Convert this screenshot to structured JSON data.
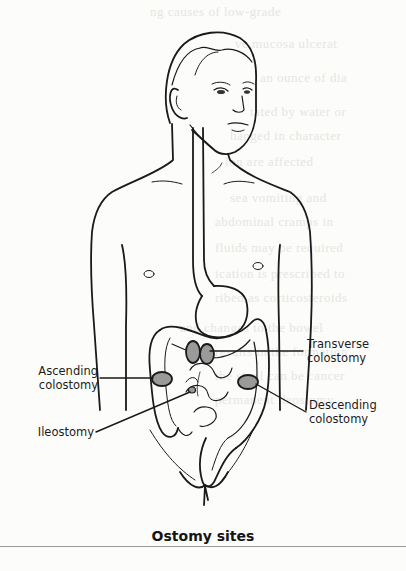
{
  "figure": {
    "title": "Ostomy sites",
    "labels": [
      {
        "id": "transverse",
        "text_line1": "Transverse",
        "text_line2": "colostomy"
      },
      {
        "id": "ascending",
        "text_line1": "Ascending",
        "text_line2": "colostomy"
      },
      {
        "id": "descending",
        "text_line1": "Descending",
        "text_line2": "colostomy"
      },
      {
        "id": "ileostomy",
        "text_line1": "Ileostomy",
        "text_line2": ""
      }
    ]
  },
  "colors": {
    "line": "#1a1a1a",
    "stoma_fill": "#9a9a9a",
    "background": "#fcfcfa",
    "bleed_text": "#e6e6e2"
  }
}
